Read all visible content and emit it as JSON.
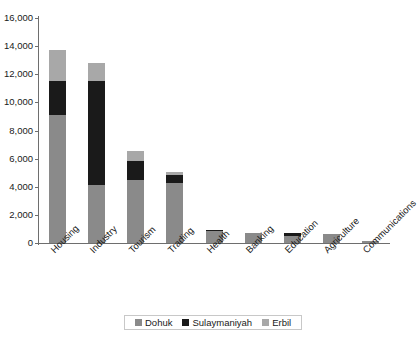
{
  "chart_data": {
    "type": "bar",
    "subtype": "stacked-vertical",
    "title": "",
    "xlabel": "",
    "ylabel": "",
    "ylim": [
      0,
      16000
    ],
    "ytick_values": [
      0,
      2000,
      4000,
      6000,
      8000,
      10000,
      12000,
      14000,
      16000
    ],
    "ytick_labels": [
      "0",
      "2,000",
      "4,000",
      "6,000",
      "8,000",
      "10,000",
      "12,000",
      "14,000",
      "16,000"
    ],
    "grid": false,
    "legend_position": "bottom",
    "categories": [
      "Housing",
      "Industry",
      "Tourism",
      "Trading",
      "Health",
      "Banking",
      "Education",
      "Agriculture",
      "Communications"
    ],
    "series": [
      {
        "name": "Dohuk",
        "color": "#8a8a8a",
        "values": [
          9100,
          4100,
          4450,
          4250,
          830,
          700,
          500,
          650,
          150
        ]
      },
      {
        "name": "Sulaymaniyah",
        "color": "#1a1a1a",
        "values": [
          2400,
          7400,
          1350,
          600,
          120,
          0,
          180,
          0,
          0
        ]
      },
      {
        "name": "Erbil",
        "color": "#a8a8a8",
        "values": [
          2200,
          1300,
          750,
          200,
          0,
          0,
          0,
          0,
          0
        ]
      }
    ],
    "totals": [
      13700,
      12800,
      6550,
      5050,
      950,
      700,
      680,
      650,
      150
    ]
  },
  "legend": {
    "items": [
      {
        "label": "Dohuk",
        "color": "#8a8a8a"
      },
      {
        "label": "Sulaymaniyah",
        "color": "#1a1a1a"
      },
      {
        "label": "Erbil",
        "color": "#a8a8a8"
      }
    ]
  }
}
